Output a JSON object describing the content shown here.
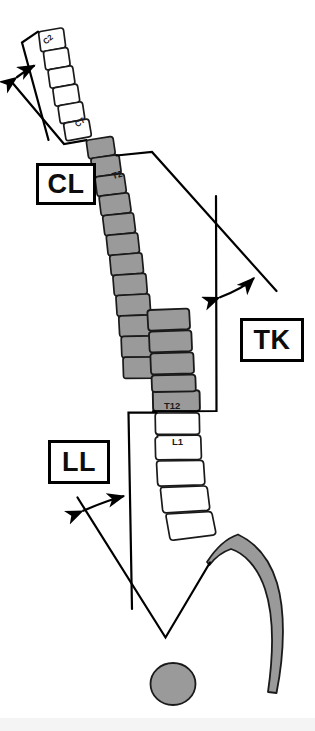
{
  "figure": {
    "background_color": "#ffffff",
    "line_color": "#000000",
    "thoracic_fill": "#9a9a9a",
    "lumbar_fill": "#ffffff",
    "cervical_fill": "#ffffff",
    "sacrum_fill": "#9a9a9a",
    "femoral_head_fill": "#9a9a9a",
    "outline_color": "#1a1a1a"
  },
  "measurements": [
    {
      "id": "cl",
      "label": "CL",
      "name": "Cervical Lordosis",
      "from_level": "C2",
      "to_level": "C7",
      "arrow_style": "double-headed-arc",
      "position": "upper-left"
    },
    {
      "id": "tk",
      "label": "TK",
      "name": "Thoracic Kyphosis",
      "from_level": "T2",
      "to_level": "T12",
      "arrow_style": "double-headed-arc",
      "position": "right"
    },
    {
      "id": "ll",
      "label": "LL",
      "name": "Lumbar Lordosis",
      "from_level": "L1",
      "to_level": "S1",
      "arrow_style": "double-headed-arc",
      "position": "lower-left"
    }
  ],
  "vertebra_labels": {
    "c2": "C2",
    "c7": "C7",
    "t2": "T2",
    "t12": "T12",
    "l1": "L1"
  },
  "segments": [
    {
      "id": "cervical",
      "levels": [
        "C2",
        "C3",
        "C4",
        "C5",
        "C6",
        "C7"
      ],
      "fill": "white",
      "count": 6
    },
    {
      "id": "thoracic",
      "levels": [
        "T2",
        "T3",
        "T4",
        "T5",
        "T6",
        "T7",
        "T8",
        "T9",
        "T10",
        "T11",
        "T12"
      ],
      "fill": "gray",
      "count": 12
    },
    {
      "id": "lumbar",
      "levels": [
        "L1",
        "L2",
        "L3",
        "L4",
        "L5"
      ],
      "fill": "white",
      "count": 5
    },
    {
      "id": "sacrum",
      "levels": [
        "S1"
      ],
      "fill": "gray",
      "count": 1
    }
  ]
}
